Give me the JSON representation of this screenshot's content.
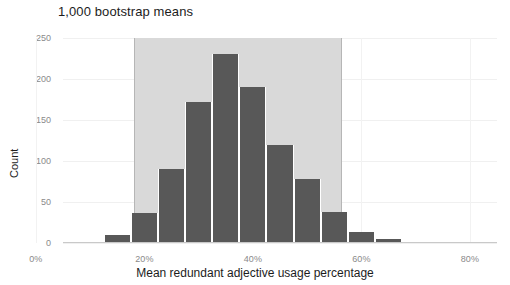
{
  "chart_data": {
    "type": "bar",
    "title": "1,000 bootstrap means",
    "xlabel": "Mean redundant adjective usage percentage",
    "ylabel": "Count",
    "categories": [
      "15%",
      "20%",
      "25%",
      "30%",
      "35%",
      "40%",
      "45%",
      "50%",
      "55%",
      "60%",
      "65%"
    ],
    "bin_centers": [
      15,
      20,
      25,
      30,
      35,
      40,
      45,
      50,
      55,
      60,
      65
    ],
    "bin_width": 5,
    "values": [
      10,
      37,
      90,
      172,
      230,
      190,
      120,
      78,
      38,
      13,
      5
    ],
    "xlim": [
      5,
      85
    ],
    "ylim": [
      0,
      250
    ],
    "xticks": [
      "0%",
      "20%",
      "40%",
      "60%",
      "80%"
    ],
    "xtick_values": [
      0,
      20,
      40,
      60,
      80
    ],
    "yticks": [
      "0",
      "50",
      "100",
      "150",
      "200",
      "250"
    ],
    "ytick_values": [
      0,
      50,
      100,
      150,
      200,
      250
    ],
    "grid": true,
    "legend": "none",
    "annotations": {
      "confidence_band": {
        "label": "95% bootstrap confidence interval shading",
        "lower": 18,
        "upper": 56.5
      }
    },
    "colors": {
      "bar": "#585858",
      "confidence_band": "#d9d9d9",
      "confidence_band_edge": "#b6b6b6",
      "grid": "#f0f0f0",
      "text": "#1c1c1c",
      "tick_text": "#8a8a8a",
      "background": "#ffffff"
    }
  }
}
